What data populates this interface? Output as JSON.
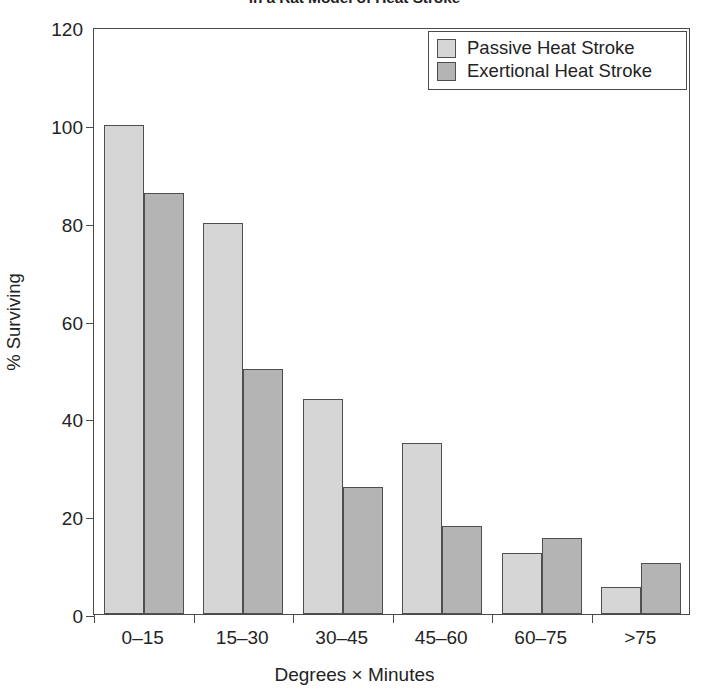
{
  "chart_data": {
    "type": "bar",
    "title": "in a Rat Model of Heat Stroke",
    "xlabel": "Degrees × Minutes",
    "ylabel": "% Surviving",
    "categories": [
      "0–15",
      "15–30",
      "30–45",
      "45–60",
      "60–75",
      ">75"
    ],
    "series": [
      {
        "name": "Passive Heat Stroke",
        "color": "#d6d6d6",
        "values": [
          100,
          80,
          44,
          35,
          12.5,
          5.5
        ]
      },
      {
        "name": "Exertional Heat Stroke",
        "color": "#b4b4b4",
        "values": [
          86,
          50,
          26,
          18,
          15.5,
          10.5
        ]
      }
    ],
    "ylim": [
      0,
      120
    ],
    "yticks": [
      0,
      20,
      40,
      60,
      80,
      100,
      120
    ],
    "ytick_labels": [
      "0",
      "20",
      "40",
      "60",
      "80",
      "100",
      "120"
    ],
    "grid": false,
    "legend_position": "top-right",
    "bar_style": "grouped"
  },
  "legend": {
    "entries": [
      {
        "label": "Passive Heat Stroke",
        "swatch": "legend-swatch-passive"
      },
      {
        "label": "Exertional Heat Stroke",
        "swatch": "legend-swatch-exertional"
      }
    ]
  }
}
